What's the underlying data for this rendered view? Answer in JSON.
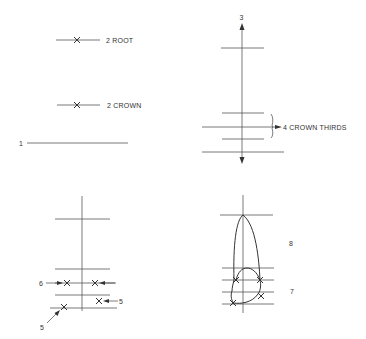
{
  "diagram": {
    "panels": [
      {
        "id": "top-left",
        "labels": {
          "root": "2  ROOT",
          "crown": "2  CROWN",
          "reference_line": "1"
        }
      },
      {
        "id": "top-right",
        "labels": {
          "axis": "3",
          "thirds": "4 CROWN THIRDS"
        }
      },
      {
        "id": "bottom-left",
        "labels": {
          "contact_points": "6",
          "height_point_right": "5",
          "height_point_left": "5"
        }
      },
      {
        "id": "bottom-right",
        "labels": {
          "outline_upper": "8",
          "outline_lower": "7"
        }
      }
    ],
    "colors": {
      "background": "#ffffff",
      "line": "#555555",
      "text": "#333333"
    }
  }
}
